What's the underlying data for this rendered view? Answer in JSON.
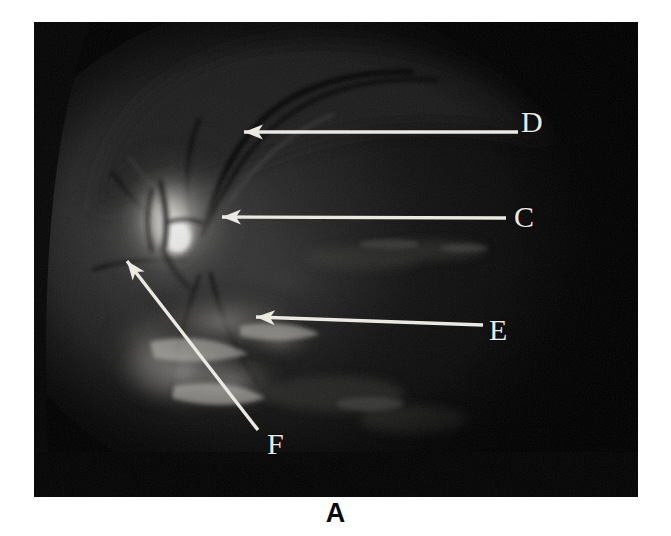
{
  "figure": {
    "panel_letter": "A",
    "modality": "retinal fundus photograph",
    "background_color": "#ffffff",
    "plate_color": "#050505",
    "annotation_color": "#ece9e3"
  },
  "image": {
    "x": 34,
    "y": 22,
    "width": 604,
    "height": 475
  },
  "annotations": [
    {
      "id": "c",
      "label": "C",
      "label_x": 514,
      "label_y": 203,
      "line": {
        "x1": 506,
        "y1": 218,
        "x2": 232,
        "y2": 217
      },
      "arrow_tip": {
        "x": 222,
        "y": 217
      },
      "style": "horizontal",
      "target": "optic disc margin"
    },
    {
      "id": "d",
      "label": "D",
      "label_x": 521,
      "label_y": 109,
      "line": {
        "x1": 518,
        "y1": 132,
        "x2": 252,
        "y2": 139
      },
      "arrow_tip": {
        "x": 244,
        "y": 132
      },
      "style": "diagonal-up-left",
      "target": "superior retina"
    },
    {
      "id": "e",
      "label": "E",
      "label_x": 488,
      "label_y": 316,
      "line": {
        "x1": 483,
        "y1": 325,
        "x2": 266,
        "y2": 310
      },
      "arrow_tip": {
        "x": 256,
        "y": 317
      },
      "style": "diagonal-down-left",
      "target": "inferior lesion"
    },
    {
      "id": "f",
      "label": "F",
      "label_x": 266,
      "label_y": 430,
      "line": {
        "x1": 258,
        "y1": 430,
        "x2": 135,
        "y2": 271
      },
      "arrow_tip": {
        "x": 127,
        "y": 261
      },
      "style": "diagonal-up-left",
      "target": "peripapillary region"
    }
  ],
  "fundus_features": {
    "optic_disc": {
      "cx": 168,
      "cy": 220,
      "rx": 34,
      "ry": 40,
      "brightness": "high"
    },
    "disc_core": {
      "cx": 175,
      "cy": 232,
      "rx": 16,
      "ry": 18,
      "brightness": "peak"
    },
    "fundus_disc_edge": {
      "cx": 300,
      "cy": 250,
      "r": 250
    },
    "lesion_band": {
      "description": "bright irregular chorioretinal band inferior to disc"
    },
    "vessel_arcade": {
      "description": "superior-temporal vascular arcade"
    }
  }
}
